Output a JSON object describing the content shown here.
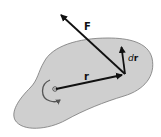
{
  "diagram": {
    "type": "rigid-body-torque-work",
    "body": {
      "fill": "#cfcfcf",
      "stroke": "#777777"
    },
    "pivot": {
      "x": 55,
      "y": 89
    },
    "vectors": [
      {
        "id": "r",
        "label": "r",
        "from": [
          55,
          89
        ],
        "to": [
          125,
          74
        ]
      },
      {
        "id": "F",
        "label": "F",
        "from": [
          125,
          74
        ],
        "to": [
          58,
          12
        ]
      },
      {
        "id": "dr",
        "label": "dr",
        "from": [
          125,
          74
        ],
        "to": [
          121,
          44
        ]
      }
    ],
    "labels": {
      "force": "F",
      "position": "r",
      "displacement_prefix": "d",
      "displacement_var": "r"
    },
    "rotation_arrow": {
      "direction": "counterclockwise"
    }
  }
}
